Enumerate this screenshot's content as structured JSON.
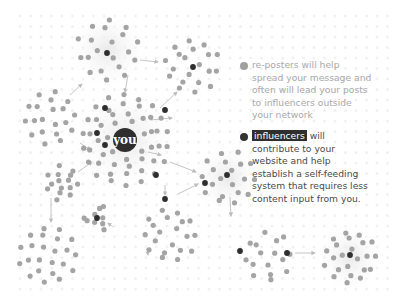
{
  "colors": {
    "background": "#ffffff",
    "reposter_node": "#a4a4a4",
    "influencer_node": "#2e2e2e",
    "arrow": "#bdbdbd",
    "grid_dot": "#f1f1f1",
    "glow": "#eeeeee"
  },
  "center": {
    "label": "you",
    "x": 125,
    "y": 140,
    "r": 12
  },
  "legend": {
    "reposters": {
      "lines": [
        "re-posters will help",
        "spread your message and",
        "often will lead your posts",
        "to influencers outside",
        "your network"
      ]
    },
    "influencers": {
      "highlight": "influencers",
      "first_line_rest": " will",
      "lines": [
        "contribute to your",
        "website and help",
        "establish a self-feeding",
        "system that requires less",
        "content input from you."
      ]
    }
  },
  "clusters": [
    {
      "name": "top-left",
      "cx": 108,
      "cy": 50,
      "r": 30,
      "glow": true,
      "count": 20,
      "influencers": [
        [
          107,
          53
        ]
      ]
    },
    {
      "name": "top-right",
      "cx": 192,
      "cy": 66,
      "r": 26,
      "glow": false,
      "count": 20,
      "influencers": [
        [
          193,
          67
        ]
      ]
    },
    {
      "name": "left",
      "cx": 50,
      "cy": 118,
      "r": 25,
      "glow": false,
      "count": 20,
      "influencers": []
    },
    {
      "name": "you-cluster",
      "cx": 125,
      "cy": 140,
      "r": 44,
      "glow": true,
      "count": 50,
      "influencers": [
        [
          105,
          108
        ],
        [
          165,
          110
        ],
        [
          97,
          133
        ],
        [
          105,
          145
        ],
        [
          156,
          175
        ]
      ]
    },
    {
      "name": "right-middle",
      "cx": 228,
      "cy": 178,
      "r": 26,
      "glow": true,
      "count": 20,
      "influencers": [
        [
          227,
          175
        ],
        [
          205,
          183
        ]
      ]
    },
    {
      "name": "left-small",
      "cx": 62,
      "cy": 183,
      "r": 16,
      "glow": false,
      "count": 14,
      "influencers": []
    },
    {
      "name": "small-lower",
      "cx": 97,
      "cy": 218,
      "r": 12,
      "glow": false,
      "count": 7,
      "influencers": [
        [
          97,
          218
        ]
      ]
    },
    {
      "name": "lower-middle",
      "cx": 170,
      "cy": 235,
      "r": 25,
      "glow": false,
      "count": 20,
      "influencers": [
        [
          165,
          199
        ]
      ]
    },
    {
      "name": "bottom-left",
      "cx": 48,
      "cy": 255,
      "r": 28,
      "glow": false,
      "count": 22,
      "influencers": []
    },
    {
      "name": "bottom-right-a",
      "cx": 268,
      "cy": 257,
      "r": 24,
      "glow": false,
      "count": 16,
      "influencers": [
        [
          240,
          251
        ],
        [
          287,
          253
        ]
      ]
    },
    {
      "name": "bottom-right-b",
      "cx": 350,
      "cy": 257,
      "r": 25,
      "glow": true,
      "count": 22,
      "influencers": [
        [
          350,
          255
        ]
      ]
    }
  ],
  "arrows": [
    [
      140,
      60,
      158,
      62
    ],
    [
      128,
      75,
      125,
      92
    ],
    [
      70,
      95,
      82,
      84
    ],
    [
      160,
      108,
      177,
      92
    ],
    [
      150,
      120,
      172,
      118
    ],
    [
      80,
      143,
      90,
      150
    ],
    [
      78,
      172,
      92,
      162
    ],
    [
      51,
      198,
      51,
      222
    ],
    [
      165,
      185,
      165,
      195
    ],
    [
      178,
      194,
      198,
      184
    ],
    [
      170,
      162,
      196,
      172
    ],
    [
      113,
      227,
      108,
      223
    ],
    [
      147,
      249,
      148,
      255
    ],
    [
      230,
      197,
      231,
      216
    ],
    [
      295,
      253,
      315,
      253
    ],
    [
      148,
      152,
      161,
      155
    ]
  ]
}
